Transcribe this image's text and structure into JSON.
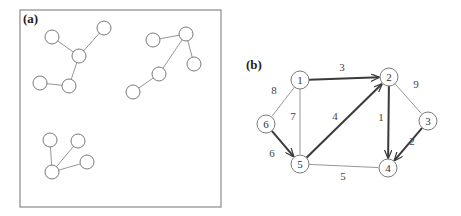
{
  "panel_a": {
    "label": "(a)",
    "clusters": [
      {
        "nodes": [
          [
            52,
            37
          ],
          [
            104,
            28
          ],
          [
            79,
            56
          ],
          [
            40,
            83
          ],
          [
            69,
            86
          ]
        ],
        "edges": [
          [
            0,
            2
          ],
          [
            1,
            2
          ],
          [
            2,
            4
          ],
          [
            3,
            4
          ]
        ]
      },
      {
        "nodes": [
          [
            153,
            40
          ],
          [
            186,
            34
          ],
          [
            194,
            64
          ],
          [
            159,
            74
          ],
          [
            133,
            92
          ]
        ],
        "edges": [
          [
            0,
            1
          ],
          [
            1,
            2
          ],
          [
            1,
            3
          ],
          [
            3,
            4
          ]
        ]
      },
      {
        "nodes": [
          [
            50,
            140
          ],
          [
            78,
            141
          ],
          [
            87,
            162
          ],
          [
            52,
            172
          ]
        ],
        "edges": [
          [
            0,
            3
          ],
          [
            1,
            3
          ],
          [
            2,
            3
          ]
        ]
      }
    ]
  },
  "panel_b": {
    "label": "(b)",
    "nodes": [
      {
        "id": "1",
        "x": 300,
        "y": 80
      },
      {
        "id": "2",
        "x": 389,
        "y": 77
      },
      {
        "id": "3",
        "x": 428,
        "y": 121
      },
      {
        "id": "4",
        "x": 388,
        "y": 168
      },
      {
        "id": "5",
        "x": 300,
        "y": 164
      },
      {
        "id": "6",
        "x": 266,
        "y": 124
      }
    ],
    "edges": [
      {
        "from": "1",
        "to": "2",
        "weight": "3",
        "directed": true,
        "lx": 342,
        "ly": 71
      },
      {
        "from": "1",
        "to": "6",
        "weight": "8",
        "directed": false,
        "lx": 274,
        "ly": 94
      },
      {
        "from": "1",
        "to": "5",
        "weight": "7",
        "directed": false,
        "lx": 293,
        "ly": 120
      },
      {
        "from": "6",
        "to": "5",
        "weight": "6",
        "directed": true,
        "lx": 272,
        "ly": 157
      },
      {
        "from": "5",
        "to": "2",
        "weight": "4",
        "directed": true,
        "lx": 335,
        "ly": 120
      },
      {
        "from": "2",
        "to": "4",
        "weight": "1",
        "directed": true,
        "lx": 381,
        "ly": 121
      },
      {
        "from": "2",
        "to": "3",
        "weight": "9",
        "directed": false,
        "lx": 416,
        "ly": 88
      },
      {
        "from": "3",
        "to": "4",
        "weight": "2",
        "directed": true,
        "lx": 412,
        "ly": 145
      },
      {
        "from": "5",
        "to": "4",
        "weight": "5",
        "directed": false,
        "lx": 343,
        "ly": 180
      }
    ]
  }
}
